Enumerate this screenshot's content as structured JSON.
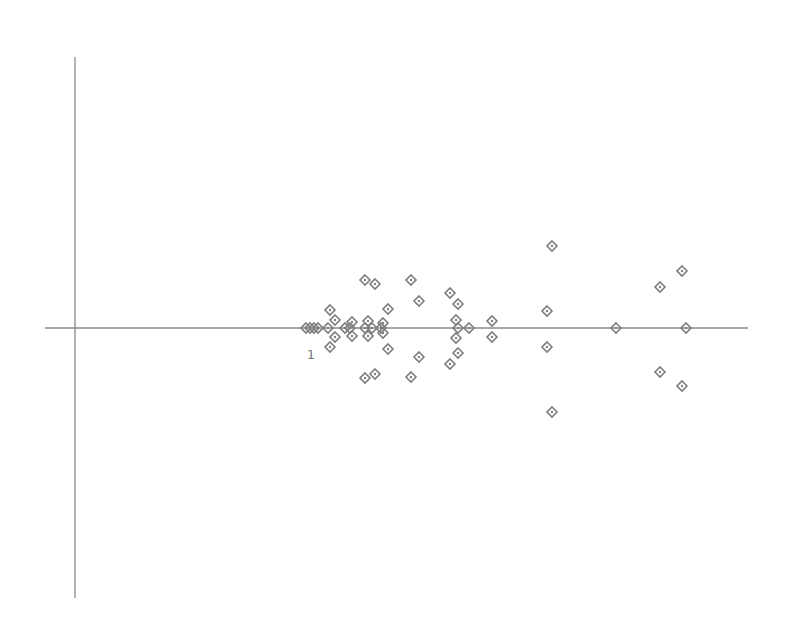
{
  "chart_data": {
    "type": "scatter",
    "title": "",
    "xlabel": "",
    "ylabel": "",
    "grid": false,
    "legend": null,
    "marker": "diamond-with-center-dot",
    "colors": {
      "axis": "#8a8a8a",
      "marker": "#7d7d7d",
      "label": "#777777",
      "background": "#ffffff"
    },
    "axes": {
      "vertical": {
        "x": 75,
        "y1": 57,
        "y2": 598
      },
      "horizontal": {
        "y": 328,
        "x1": 45,
        "x2": 748
      }
    },
    "annotations": [
      {
        "text": "1",
        "x": 311,
        "y": 359
      }
    ],
    "points_px": [
      [
        306,
        328
      ],
      [
        310,
        328
      ],
      [
        314,
        328
      ],
      [
        318,
        328
      ],
      [
        330,
        310
      ],
      [
        335,
        320
      ],
      [
        328,
        328
      ],
      [
        335,
        337
      ],
      [
        330,
        347
      ],
      [
        345,
        328
      ],
      [
        350,
        328
      ],
      [
        352,
        322
      ],
      [
        352,
        336
      ],
      [
        365,
        280
      ],
      [
        375,
        284
      ],
      [
        411,
        280
      ],
      [
        419,
        301
      ],
      [
        388,
        309
      ],
      [
        368,
        321
      ],
      [
        383,
        323
      ],
      [
        365,
        328
      ],
      [
        372,
        328
      ],
      [
        381,
        328
      ],
      [
        368,
        336
      ],
      [
        383,
        333
      ],
      [
        388,
        349
      ],
      [
        419,
        357
      ],
      [
        365,
        378
      ],
      [
        375,
        374
      ],
      [
        411,
        377
      ],
      [
        450,
        293
      ],
      [
        458,
        304
      ],
      [
        456,
        320
      ],
      [
        458,
        328
      ],
      [
        469,
        328
      ],
      [
        456,
        338
      ],
      [
        458,
        353
      ],
      [
        450,
        364
      ],
      [
        492,
        321
      ],
      [
        492,
        337
      ],
      [
        552,
        246
      ],
      [
        547,
        311
      ],
      [
        547,
        347
      ],
      [
        552,
        412
      ],
      [
        616,
        328
      ],
      [
        682,
        271
      ],
      [
        660,
        287
      ],
      [
        686,
        328
      ],
      [
        660,
        372
      ],
      [
        682,
        386
      ]
    ]
  }
}
